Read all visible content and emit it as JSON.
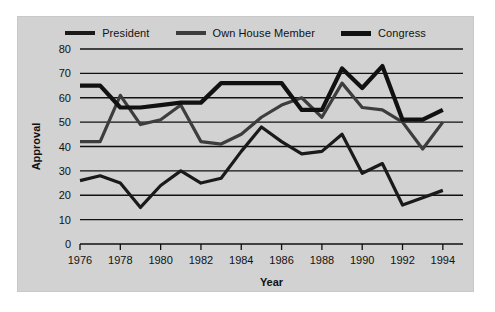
{
  "chart_data": {
    "type": "line",
    "title": "",
    "xlabel": "Year",
    "ylabel": "Approval",
    "xlim": [
      1976,
      1995
    ],
    "ylim": [
      0,
      80
    ],
    "ytick_step": 10,
    "yticks": [
      0,
      10,
      20,
      30,
      40,
      50,
      60,
      70,
      80
    ],
    "xticks": [
      1976,
      1978,
      1980,
      1982,
      1984,
      1986,
      1988,
      1990,
      1992,
      1994
    ],
    "xtick_labels": [
      "1976",
      "1978",
      "1980",
      "1982",
      "1984",
      "1986",
      "1988",
      "1990",
      "1992",
      "1994"
    ],
    "ytick_labels": [
      "0",
      "10",
      "20",
      "30",
      "40",
      "50",
      "60",
      "70",
      "80"
    ],
    "grid": true,
    "grid_axis": "y",
    "legend_position": "top-center",
    "x": [
      1976,
      1977,
      1978,
      1979,
      1980,
      1981,
      1982,
      1983,
      1984,
      1985,
      1986,
      1987,
      1988,
      1989,
      1990,
      1991,
      1992,
      1993,
      1994
    ],
    "series": [
      {
        "name": "President",
        "color": "#1a1a1a",
        "values": [
          26,
          28,
          25,
          15,
          24,
          30,
          25,
          27,
          38,
          48,
          42,
          37,
          38,
          45,
          29,
          33,
          16,
          19,
          22
        ]
      },
      {
        "name": "Own House Member",
        "color": "#3d3d3d",
        "values": [
          42,
          42,
          61,
          49,
          51,
          57,
          42,
          41,
          45,
          52,
          57,
          60,
          52,
          66,
          56,
          55,
          50,
          39,
          50
        ]
      },
      {
        "name": "Congress",
        "color": "#111111",
        "values": [
          65,
          65,
          56,
          56,
          57,
          58,
          58,
          66,
          66,
          66,
          66,
          55,
          55,
          72,
          64,
          73,
          51,
          51,
          55
        ]
      }
    ]
  },
  "legend": {
    "items": [
      {
        "label": "President",
        "swatch": "line-swatch-president"
      },
      {
        "label": "Own House Member",
        "swatch": "line-swatch-own-house-member"
      },
      {
        "label": "Congress",
        "swatch": "line-swatch-congress"
      }
    ]
  },
  "axes": {
    "y_title": "Approval",
    "x_title": "Year"
  },
  "colors": {
    "panel_background": "#d2d2d2",
    "figure_background": "#ffffff",
    "axis": "#111111",
    "grid": "#111111"
  }
}
